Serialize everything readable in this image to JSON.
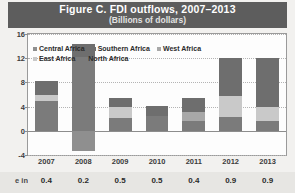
{
  "header": {
    "title": "Figure C. FDI outflows, 2007–2013",
    "subtitle": "(Billions of dollars)"
  },
  "colors": {
    "header_band": "#5d5d5d",
    "central_africa": "#8f8f8f",
    "southern_africa": "#6e6e6e",
    "west_africa": "#a8a8a8",
    "east_africa": "#c9c9c9",
    "north_africa": "#7b7b7b",
    "plot_background": "#fdfdfd",
    "page_background": "#f2f1ef",
    "strip_background": "#e7e6e3"
  },
  "legend": {
    "rows": [
      [
        {
          "label": "Central Africa",
          "color": "#8f8f8f"
        },
        {
          "label": "Southern Africa",
          "color": "#6e6e6e"
        },
        {
          "label": "West Africa",
          "color": "#a8a8a8"
        }
      ],
      [
        {
          "label": "East Africa",
          "color": "#c9c9c9"
        },
        {
          "label": "North Africa",
          "color": "#7b7b7b"
        }
      ]
    ]
  },
  "value_strip": {
    "label": "e in",
    "values": [
      "0.4",
      "0.2",
      "0.5",
      "0.5",
      "0.4",
      "0.9",
      "0.9"
    ]
  },
  "chart_data": {
    "type": "bar",
    "title": "Figure C. FDI outflows, 2007–2013",
    "subtitle": "(Billions of dollars)",
    "xlabel": "",
    "ylabel": "Billions of dollars",
    "ylim": [
      -4,
      16
    ],
    "yticks": [
      16,
      12,
      8,
      4,
      0,
      -4
    ],
    "grid": true,
    "legend_position": "top-left-inside",
    "stacked": true,
    "categories": [
      "2007",
      "2008",
      "2009",
      "2010",
      "2011",
      "2012",
      "2013"
    ],
    "series": [
      {
        "name": "North Africa",
        "color": "#7b7b7b",
        "values": [
          5.0,
          12.2,
          2.1,
          2.5,
          1.6,
          2.3,
          1.6
        ]
      },
      {
        "name": "East Africa",
        "color": "#c9c9c9",
        "values": [
          0.9,
          0.0,
          1.8,
          0.0,
          0.0,
          3.5,
          2.3
        ]
      },
      {
        "name": "West Africa",
        "color": "#a8a8a8",
        "values": [
          0.0,
          0.0,
          0.0,
          0.0,
          1.5,
          0.0,
          0.0
        ]
      },
      {
        "name": "Southern Africa",
        "color": "#6e6e6e",
        "values": [
          2.4,
          2.1,
          1.5,
          1.6,
          2.4,
          6.3,
          8.2
        ]
      },
      {
        "name": "Central Africa",
        "color": "#8f8f8f",
        "values": [
          0.0,
          -3.4,
          0.0,
          0.0,
          0.0,
          0.0,
          0.0
        ]
      }
    ],
    "totals_positive": [
      8.3,
      14.3,
      5.4,
      4.1,
      5.5,
      12.1,
      12.1
    ],
    "totals_negative": [
      0.0,
      -3.4,
      0.0,
      0.0,
      0.0,
      0.0,
      0.0
    ]
  }
}
